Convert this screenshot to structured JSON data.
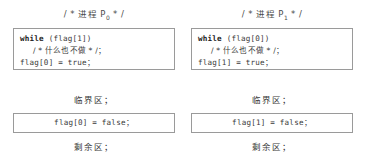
{
  "figure": {
    "type": "algorithm-pseudocode-diagram"
  },
  "columns": [
    {
      "id": "process-p0",
      "header": {
        "prefix": "/ * ",
        "text": "进程 P",
        "subscript": "0",
        "suffix": " * /",
        "full": "/ * 进程 P₀ * /"
      },
      "entry_box": {
        "lines": [
          {
            "keyword": "while",
            "rest": " (flag[1])"
          },
          {
            "keyword": "",
            "rest": "/ * 什么也不做 * /；",
            "indent": true
          },
          {
            "keyword": "",
            "rest": "flag[0] = true；"
          }
        ]
      },
      "critical_label": "临界区；",
      "exit_box": {
        "line": "flag[0] = false；"
      },
      "remainder_label": "剩余区；"
    },
    {
      "id": "process-p1",
      "header": {
        "prefix": "/ * ",
        "text": "进程 P",
        "subscript": "1",
        "suffix": " * /",
        "full": "/ * 进程 P₁ * /"
      },
      "entry_box": {
        "lines": [
          {
            "keyword": "while",
            "rest": " (flag[0])"
          },
          {
            "keyword": "",
            "rest": "/ * 什么也不做 * /；",
            "indent": true
          },
          {
            "keyword": "",
            "rest": "flag[1] = true；"
          }
        ]
      },
      "critical_label": "临界区；",
      "exit_box": {
        "line": "flag[1] = false；"
      },
      "remainder_label": "剩余区；"
    }
  ],
  "colors": {
    "background": "#ffffff",
    "box_border": "#9a9a9a",
    "code_text": "#3a3a3a",
    "keyword_text": "#1a1a1a",
    "header_text": "#4a4a4a"
  }
}
